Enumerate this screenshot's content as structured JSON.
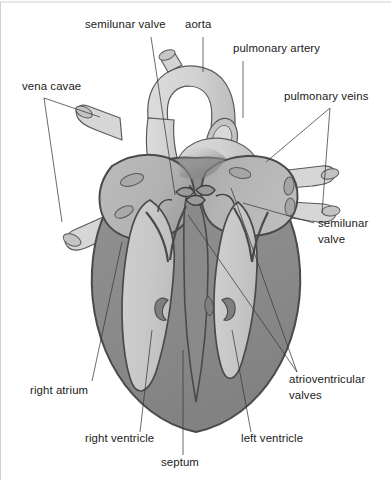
{
  "figure": {
    "background_color": "#ffffff",
    "width": 391,
    "height": 480
  },
  "palette": {
    "chamber_light": "#c9c9c9",
    "atrium_gray": "#b5b5b5",
    "myocardium_gray": "#8a8a8a",
    "vessel_light": "#d8d8d8",
    "vessel_shadow": "#b0b0b0",
    "outline_dark": "#4a4a4a",
    "outline_mid": "#6f6f6f",
    "label_text": "#1a1a1a",
    "leader_line": "#3a3a3a",
    "frame_line": "#cfcfcf"
  },
  "labels": [
    {
      "id": "semilunar-valve-left",
      "text": "semilunar valve",
      "lines": [
        "semilunar valve"
      ],
      "x": 85,
      "y": 28,
      "anchor": "start",
      "leader": [
        [
          151,
          37
        ],
        [
          175,
          195
        ]
      ]
    },
    {
      "id": "aorta",
      "text": "aorta",
      "lines": [
        "aorta"
      ],
      "x": 185,
      "y": 28,
      "anchor": "start",
      "leader": [
        [
          203,
          37
        ],
        [
          203,
          72
        ]
      ]
    },
    {
      "id": "pulmonary-artery",
      "text": "pulmonary artery",
      "lines": [
        "pulmonary artery"
      ],
      "x": 233,
      "y": 52,
      "anchor": "start",
      "leader": [
        [
          243,
          61
        ],
        [
          243,
          118
        ]
      ]
    },
    {
      "id": "pulmonary-veins",
      "text": "pulmonary veins",
      "lines": [
        "pulmonary veins"
      ],
      "x": 284,
      "y": 100,
      "anchor": "start",
      "leader": [
        [
          330,
          108
        ],
        [
          266,
          162
        ]
      ],
      "leader2": [
        [
          330,
          108
        ],
        [
          322,
          213
        ]
      ]
    },
    {
      "id": "vena-cavae",
      "text": "vena cavae",
      "lines": [
        "vena cavae"
      ],
      "x": 22,
      "y": 90,
      "anchor": "start",
      "leader": [
        [
          44,
          98
        ],
        [
          100,
          117
        ]
      ],
      "leader2": [
        [
          44,
          98
        ],
        [
          62,
          222
        ]
      ]
    },
    {
      "id": "semilunar-valve-right",
      "text": "semilunar valve",
      "lines": [
        "semilunar",
        "valve"
      ],
      "x": 318,
      "y": 227,
      "anchor": "start",
      "leader": [
        [
          314,
          223
        ],
        [
          243,
          203
        ]
      ]
    },
    {
      "id": "atrioventricular-valves",
      "text": "atrioventricular valves",
      "lines": [
        "atrioventricular",
        "valves"
      ],
      "x": 289,
      "y": 383,
      "anchor": "start",
      "leader": [
        [
          297,
          372
        ],
        [
          188,
          215
        ]
      ],
      "leader2": [
        [
          297,
          372
        ],
        [
          231,
          188
        ]
      ]
    },
    {
      "id": "right-atrium",
      "text": "right atrium",
      "lines": [
        "right atrium"
      ],
      "x": 30,
      "y": 394,
      "anchor": "start",
      "leader": [
        [
          92,
          381
        ],
        [
          122,
          242
        ]
      ]
    },
    {
      "id": "right-ventricle",
      "text": "right ventricle",
      "lines": [
        "right ventricle"
      ],
      "x": 85,
      "y": 442,
      "anchor": "start",
      "leader": [
        [
          140,
          432
        ],
        [
          152,
          330
        ]
      ]
    },
    {
      "id": "septum",
      "text": "septum",
      "lines": [
        "septum"
      ],
      "x": 161,
      "y": 466,
      "anchor": "start",
      "leader": [
        [
          183,
          455
        ],
        [
          183,
          350
        ]
      ]
    },
    {
      "id": "left-ventricle",
      "text": "left ventricle",
      "lines": [
        "left ventricle"
      ],
      "x": 241,
      "y": 442,
      "anchor": "start",
      "leader": [
        [
          251,
          432
        ],
        [
          232,
          330
        ]
      ]
    }
  ],
  "structures": {
    "aorta": "aorta-vessel",
    "pulmonary_artery": "pulmonary-artery-vessel",
    "pulmonary_veins": "pulmonary-vein-vessels",
    "vena_cavae": "vena-cava-vessels",
    "right_atrium": "right-atrium-chamber",
    "left_atrium": "left-atrium-chamber",
    "right_ventricle": "right-ventricle-chamber",
    "left_ventricle": "left-ventricle-chamber",
    "septum": "interventricular-septum",
    "semilunar_valves": "semilunar-valve-cusps",
    "av_valves": "atrioventricular-valve-leaflets"
  }
}
